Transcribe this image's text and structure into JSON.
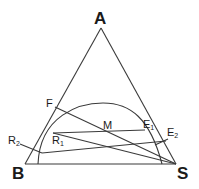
{
  "diagram": {
    "type": "ternary phase diagram (liquid-liquid extraction)",
    "vertices": {
      "A": {
        "label": "A"
      },
      "B": {
        "label": "B"
      },
      "S": {
        "label": "S"
      }
    },
    "points": {
      "F": {
        "label": "F"
      },
      "M": {
        "label": "M"
      },
      "R1": {
        "label": "R",
        "sub": "1"
      },
      "R2": {
        "label": "R",
        "sub": "2"
      },
      "E1": {
        "label": "E",
        "sub": "1"
      },
      "E2": {
        "label": "E",
        "sub": "2"
      }
    },
    "lines": [
      "F-S",
      "R1-E1",
      "R1-S",
      "R2-E2",
      "B-S",
      "A-B",
      "A-S"
    ],
    "curves": [
      "binodal solubility curve"
    ],
    "colors": {
      "stroke": "#3a3a3a",
      "text": "#1a1a1a",
      "background": "#ffffff"
    }
  }
}
